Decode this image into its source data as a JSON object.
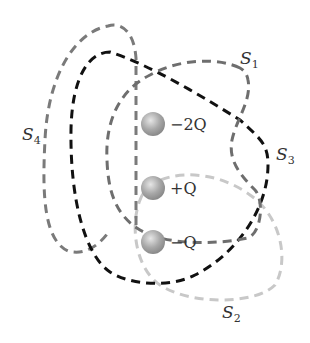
{
  "diagram": {
    "surfaces": [
      {
        "id": "S1",
        "label": "S",
        "subscript": "1",
        "color": "#6e6e6e"
      },
      {
        "id": "S2",
        "label": "S",
        "subscript": "2",
        "color": "#c8c8c8"
      },
      {
        "id": "S3",
        "label": "S",
        "subscript": "3",
        "color": "#111111"
      },
      {
        "id": "S4",
        "label": "S",
        "subscript": "4",
        "color": "#7a7a7a"
      }
    ],
    "charges": [
      {
        "label": "−2Q",
        "sign": "−",
        "value": "2",
        "symbol": "Q"
      },
      {
        "label": "+Q",
        "sign": "+",
        "value": "",
        "symbol": "Q"
      },
      {
        "label": "−Q",
        "sign": "−",
        "value": "",
        "symbol": "Q"
      }
    ]
  }
}
